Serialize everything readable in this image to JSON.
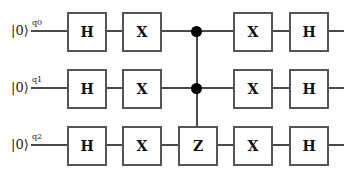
{
  "circuit": {
    "qubits": [
      {
        "name": "q0",
        "init": "|0⟩"
      },
      {
        "name": "q1",
        "init": "|0⟩"
      },
      {
        "name": "q2",
        "init": "|0⟩"
      }
    ],
    "columns": [
      {
        "q0": "H",
        "q1": "H",
        "q2": "H"
      },
      {
        "q0": "X",
        "q1": "X",
        "q2": "X"
      },
      {
        "q0": "control",
        "q1": "control",
        "q2": "Z"
      },
      {
        "q0": "X",
        "q1": "X",
        "q2": "X"
      },
      {
        "q0": "H",
        "q1": "H",
        "q2": "H"
      }
    ],
    "gates": {
      "q0": [
        "H",
        "X",
        "X",
        "H"
      ],
      "q1": [
        "H",
        "X",
        "X",
        "H"
      ],
      "q2": [
        "H",
        "X",
        "Z",
        "X",
        "H"
      ]
    },
    "controlled_gate": {
      "controls": [
        "q0",
        "q1"
      ],
      "target": "q2",
      "label": "Z"
    }
  },
  "colors": {
    "wire": "#4a4a4a",
    "gate_border": "#555555",
    "control_dot": "#000000",
    "background": "#ffffff"
  }
}
